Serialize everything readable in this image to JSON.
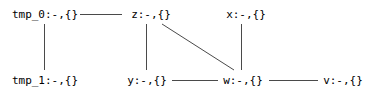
{
  "diagram": {
    "type": "graph",
    "width": 371,
    "height": 95,
    "background_color": "#ffffff",
    "line_color": "#4a4a4a",
    "text_color": "#000000",
    "nodes": [
      {
        "id": "tmp_0",
        "label": "tmp_0:-,{}",
        "x": 45,
        "y": 14,
        "row": "top"
      },
      {
        "id": "z",
        "label": "z:-,{}",
        "x": 151,
        "y": 14,
        "row": "top"
      },
      {
        "id": "x",
        "label": "x:-,{}",
        "x": 246,
        "y": 14,
        "row": "top"
      },
      {
        "id": "tmp_1",
        "label": "tmp_1:-,{}",
        "x": 45,
        "y": 80,
        "row": "bottom"
      },
      {
        "id": "y",
        "label": "y:-,{}",
        "x": 147,
        "y": 80,
        "row": "bottom"
      },
      {
        "id": "w",
        "label": "w:-,{}",
        "x": 243,
        "y": 80,
        "row": "bottom"
      },
      {
        "id": "v",
        "label": "v:-,{}",
        "x": 343,
        "y": 80,
        "row": "bottom"
      }
    ],
    "edges": [
      {
        "from": "tmp_0",
        "to": "z",
        "kind": "horizontal",
        "x1": 80,
        "y1": 14,
        "x2": 122,
        "y2": 14
      },
      {
        "from": "tmp_0",
        "to": "tmp_1",
        "kind": "vertical",
        "x1": 44,
        "y1": 24,
        "x2": 44,
        "y2": 70
      },
      {
        "from": "z",
        "to": "y",
        "kind": "vertical",
        "x1": 146,
        "y1": 24,
        "x2": 146,
        "y2": 70
      },
      {
        "from": "z",
        "to": "w",
        "kind": "diagonal",
        "x1": 162,
        "y1": 24,
        "x2": 234,
        "y2": 70
      },
      {
        "from": "x",
        "to": "w",
        "kind": "vertical",
        "x1": 241,
        "y1": 24,
        "x2": 241,
        "y2": 70
      },
      {
        "from": "y",
        "to": "w",
        "kind": "horizontal",
        "x1": 172,
        "y1": 80,
        "x2": 218,
        "y2": 80
      },
      {
        "from": "w",
        "to": "v",
        "kind": "horizontal",
        "x1": 269,
        "y1": 80,
        "x2": 318,
        "y2": 80
      }
    ]
  }
}
